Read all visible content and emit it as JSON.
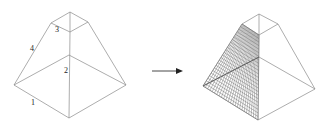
{
  "diagram": {
    "type": "geometry-transformation",
    "colors": {
      "edge": "#8a8a8a",
      "mesh": "#6a6a6a",
      "label": "#222222",
      "arrow": "#222222"
    },
    "left_shape": {
      "name": "frustum-wireframe",
      "vertices": {
        "base_left": [
          14,
          85
        ],
        "base_front": [
          69,
          118
        ],
        "base_right": [
          126,
          85
        ],
        "base_back": [
          69,
          55
        ],
        "top_left": [
          51,
          23
        ],
        "top_front": [
          70,
          32
        ],
        "top_right": [
          88,
          22
        ],
        "top_back": [
          70,
          12
        ]
      },
      "edge_labels": [
        {
          "text": "1",
          "x": 31,
          "y": 105
        },
        {
          "text": "2",
          "x": 64,
          "y": 73
        },
        {
          "text": "3",
          "x": 55,
          "y": 32
        },
        {
          "text": "4",
          "x": 30,
          "y": 51
        }
      ]
    },
    "arrow": {
      "from": [
        152,
        71
      ],
      "to": [
        183,
        71
      ]
    },
    "right_shape": {
      "name": "frustum-meshed-face",
      "vertices": {
        "base_left": [
          203,
          86
        ],
        "base_front": [
          258,
          120
        ],
        "base_right": [
          315,
          89
        ],
        "base_back": [
          259,
          57
        ],
        "top_left": [
          242,
          24
        ],
        "top_front": [
          259,
          35
        ],
        "top_right": [
          278,
          24
        ],
        "top_back": [
          259,
          14
        ]
      },
      "mesh_divisions": 24
    }
  }
}
